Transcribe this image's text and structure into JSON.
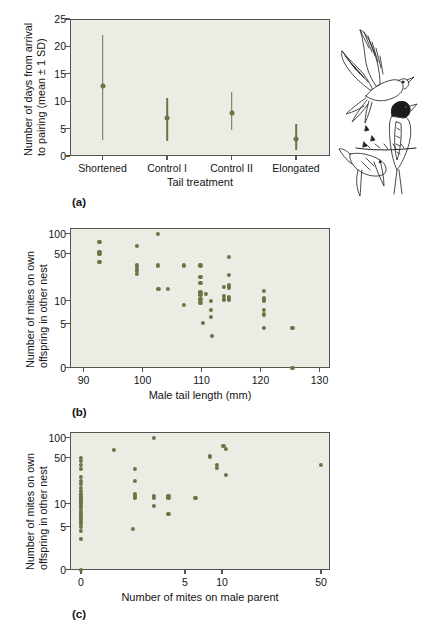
{
  "figure": {
    "illustration": "barn-swallow-pair-line-drawing"
  },
  "panels": [
    {
      "letter": "(a)",
      "xlabel": "Tail treatment",
      "ylabel_line1": "Number of days from arrival",
      "ylabel_line2": "to pairing (mean ± 1 SD)",
      "ytick_labels": [
        "0",
        "5",
        "10",
        "15",
        "20",
        "25"
      ],
      "xtick_labels": [
        "Shortened",
        "Control I",
        "Control II",
        "Elongated"
      ]
    },
    {
      "letter": "(b)",
      "xlabel": "Male tail length (mm)",
      "ylabel_line1": "Number of mites on own",
      "ylabel_line2": "offspring in other nest",
      "ytick_labels": [
        "0",
        "5",
        "10",
        "50",
        "100"
      ],
      "xtick_labels": [
        "90",
        "100",
        "110",
        "120",
        "130"
      ]
    },
    {
      "letter": "(c)",
      "xlabel": "Number of mites on male parent",
      "ylabel_line1": "Number of mites on own",
      "ylabel_line2": "offspring in other nest",
      "ytick_labels": [
        "0",
        "5",
        "10",
        "50",
        "100"
      ],
      "xtick_labels": [
        "0",
        "5",
        "10",
        "50"
      ]
    }
  ],
  "colors": {
    "marker": "#6e7245",
    "plot_background": "#ebece4",
    "axis": "#55544f",
    "text": "#141414"
  },
  "chart_data": [
    {
      "type": "scatter",
      "panel": "a",
      "subtype": "mean-with-error-bars",
      "title": "",
      "xlabel": "Tail treatment",
      "ylabel": "Number of days from arrival to pairing (mean ± 1 SD)",
      "categories": [
        "Shortened",
        "Control I",
        "Control II",
        "Elongated"
      ],
      "means": [
        12.7,
        7.0,
        7.8,
        3.1
      ],
      "error_low": [
        2.9,
        2.8,
        3.4,
        1.0
      ],
      "error_high": [
        22.0,
        10.5,
        11.6,
        5.8
      ],
      "ylim": [
        0,
        25
      ],
      "yticks": [
        0,
        5,
        10,
        15,
        20,
        25
      ],
      "grid": false,
      "legend": "none"
    },
    {
      "type": "scatter",
      "panel": "b",
      "title": "",
      "xlabel": "Male tail length (mm)",
      "ylabel": "Number of mites on own offspring in other nest",
      "xlim": [
        88,
        132
      ],
      "xticks": [
        90,
        100,
        110,
        120,
        130
      ],
      "yticks": [
        0,
        5,
        10,
        50,
        100
      ],
      "y_scale": "log-like (0,5,10,50,100)",
      "grid": false,
      "legend": "none",
      "points": [
        {
          "x": 92.7,
          "y": 80
        },
        {
          "x": 92.7,
          "y": 55
        },
        {
          "x": 92.7,
          "y": 50
        },
        {
          "x": 92.7,
          "y": 43
        },
        {
          "x": 99.0,
          "y": 70
        },
        {
          "x": 99.0,
          "y": 40
        },
        {
          "x": 99.0,
          "y": 37
        },
        {
          "x": 99.0,
          "y": 35
        },
        {
          "x": 99.0,
          "y": 33
        },
        {
          "x": 102.6,
          "y": 100
        },
        {
          "x": 102.6,
          "y": 40
        },
        {
          "x": 102.7,
          "y": 20
        },
        {
          "x": 104.3,
          "y": 20
        },
        {
          "x": 107.0,
          "y": 40
        },
        {
          "x": 107.0,
          "y": 9
        },
        {
          "x": 109.8,
          "y": 40
        },
        {
          "x": 109.8,
          "y": 30
        },
        {
          "x": 109.8,
          "y": 25
        },
        {
          "x": 109.8,
          "y": 17
        },
        {
          "x": 109.8,
          "y": 15
        },
        {
          "x": 109.8,
          "y": 11
        },
        {
          "x": 109.8,
          "y": 9.5
        },
        {
          "x": 110.7,
          "y": 16
        },
        {
          "x": 110.3,
          "y": 5.2
        },
        {
          "x": 111.6,
          "y": 10
        },
        {
          "x": 111.6,
          "y": 8
        },
        {
          "x": 111.6,
          "y": 6.5
        },
        {
          "x": 111.8,
          "y": 3.6
        },
        {
          "x": 113.8,
          "y": 22
        },
        {
          "x": 113.8,
          "y": 14
        },
        {
          "x": 113.8,
          "y": 11
        },
        {
          "x": 114.6,
          "y": 47
        },
        {
          "x": 114.6,
          "y": 32
        },
        {
          "x": 114.6,
          "y": 23
        },
        {
          "x": 114.6,
          "y": 21
        },
        {
          "x": 114.6,
          "y": 13
        },
        {
          "x": 114.6,
          "y": 11
        },
        {
          "x": 120.6,
          "y": 18
        },
        {
          "x": 120.6,
          "y": 12
        },
        {
          "x": 120.6,
          "y": 11
        },
        {
          "x": 120.6,
          "y": 10
        },
        {
          "x": 120.6,
          "y": 8
        },
        {
          "x": 120.6,
          "y": 7
        },
        {
          "x": 120.6,
          "y": 4.5
        },
        {
          "x": 125.4,
          "y": 4.5
        },
        {
          "x": 125.4,
          "y": 0
        }
      ]
    },
    {
      "type": "scatter",
      "panel": "c",
      "title": "",
      "xlabel": "Number of mites on male parent",
      "ylabel": "Number of mites on own offspring in other nest",
      "xticks": [
        0,
        5,
        10,
        50
      ],
      "yticks": [
        0,
        5,
        10,
        50,
        100
      ],
      "x_scale": "log-like (0,5,10,50)",
      "y_scale": "log-like (0,5,10,50,100)",
      "grid": false,
      "legend": "none",
      "points": [
        {
          "x": 0,
          "y": 50
        },
        {
          "x": 0,
          "y": 47
        },
        {
          "x": 0,
          "y": 44
        },
        {
          "x": 0,
          "y": 40
        },
        {
          "x": 0,
          "y": 33
        },
        {
          "x": 0,
          "y": 30
        },
        {
          "x": 0,
          "y": 27
        },
        {
          "x": 0,
          "y": 24
        },
        {
          "x": 0,
          "y": 21
        },
        {
          "x": 0,
          "y": 18
        },
        {
          "x": 0,
          "y": 16
        },
        {
          "x": 0,
          "y": 15
        },
        {
          "x": 0,
          "y": 13
        },
        {
          "x": 0,
          "y": 12
        },
        {
          "x": 0,
          "y": 11
        },
        {
          "x": 0,
          "y": 10
        },
        {
          "x": 0,
          "y": 9.5
        },
        {
          "x": 0,
          "y": 9
        },
        {
          "x": 0,
          "y": 8.5
        },
        {
          "x": 0,
          "y": 8
        },
        {
          "x": 0,
          "y": 7.5
        },
        {
          "x": 0,
          "y": 7
        },
        {
          "x": 0,
          "y": 6.5
        },
        {
          "x": 0,
          "y": 6
        },
        {
          "x": 0,
          "y": 5.5
        },
        {
          "x": 0,
          "y": 5
        },
        {
          "x": 0,
          "y": 4.5
        },
        {
          "x": 0,
          "y": 3.6
        },
        {
          "x": 0,
          "y": 0
        },
        {
          "x": 1.6,
          "y": 70
        },
        {
          "x": 2.6,
          "y": 40
        },
        {
          "x": 2.6,
          "y": 30
        },
        {
          "x": 2.6,
          "y": 18
        },
        {
          "x": 2.6,
          "y": 16
        },
        {
          "x": 2.6,
          "y": 15
        },
        {
          "x": 2.5,
          "y": 4.7
        },
        {
          "x": 3.5,
          "y": 100
        },
        {
          "x": 3.5,
          "y": 17
        },
        {
          "x": 3.5,
          "y": 15
        },
        {
          "x": 3.5,
          "y": 9.5
        },
        {
          "x": 4.2,
          "y": 17
        },
        {
          "x": 4.2,
          "y": 15
        },
        {
          "x": 4.2,
          "y": 7.8
        },
        {
          "x": 6.4,
          "y": 15
        },
        {
          "x": 8.4,
          "y": 53
        },
        {
          "x": 9.3,
          "y": 44
        },
        {
          "x": 9.3,
          "y": 41
        },
        {
          "x": 10.6,
          "y": 80
        },
        {
          "x": 11.6,
          "y": 72
        },
        {
          "x": 11.6,
          "y": 35
        },
        {
          "x": 50,
          "y": 44
        }
      ]
    }
  ]
}
